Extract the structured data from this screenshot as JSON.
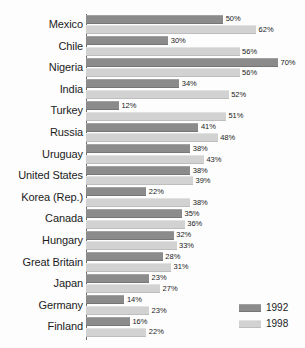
{
  "chart_data": {
    "type": "bar",
    "orientation": "horizontal",
    "title": "",
    "xlabel": "",
    "ylabel": "",
    "grid": false,
    "legend_position": "bottom-right",
    "xlim": [
      0,
      70
    ],
    "value_suffix": "%",
    "categories": [
      "Mexico",
      "Chile",
      "Nigeria",
      "India",
      "Turkey",
      "Russia",
      "Uruguay",
      "United States",
      "Korea (Rep.)",
      "Canada",
      "Hungary",
      "Great Britain",
      "Japan",
      "Germany",
      "Finland"
    ],
    "series": [
      {
        "name": "1992",
        "color": "#8b8b8b",
        "values": [
          50,
          30,
          70,
          34,
          12,
          41,
          38,
          38,
          22,
          35,
          32,
          28,
          23,
          14,
          16
        ],
        "labels": [
          "50%",
          "30%",
          "70%",
          "34%",
          "12%",
          "41%",
          "38%",
          "38%",
          "22%",
          "35%",
          "32%",
          "28%",
          "23%",
          "14%",
          "16%"
        ]
      },
      {
        "name": "1998",
        "color": "#d2d2d2",
        "values": [
          62,
          56,
          56,
          52,
          51,
          48,
          43,
          39,
          38,
          36,
          33,
          31,
          27,
          23,
          22
        ],
        "labels": [
          "62%",
          "56%",
          "56%",
          "52%",
          "51%",
          "48%",
          "43%",
          "39%",
          "38%",
          "36%",
          "33%",
          "31%",
          "27%",
          "23%",
          "22%"
        ]
      }
    ],
    "legend": [
      {
        "label": "1992",
        "color": "#8b8b8b"
      },
      {
        "label": "1998",
        "color": "#d2d2d2"
      }
    ]
  }
}
